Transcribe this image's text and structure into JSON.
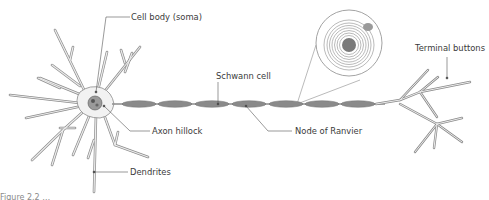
{
  "diagram": {
    "type": "neuron-anatomy",
    "colors": {
      "outline": "#8c8c8c",
      "dendrite_fill": "#e6e6e6",
      "myelin_fill": "#8a8a8a",
      "leader_line": "#555555",
      "label_text": "#3a3a3a"
    },
    "labels": {
      "cell_body": "Cell body (soma)",
      "axon_hillock": "Axon hillock",
      "dendrites": "Dendrites",
      "schwann_cell": "Schwann cell",
      "node_of_ranvier": "Node of Ranvier",
      "terminal_buttons": "Terminal buttons"
    },
    "caption": "Figure 2.2 …"
  }
}
